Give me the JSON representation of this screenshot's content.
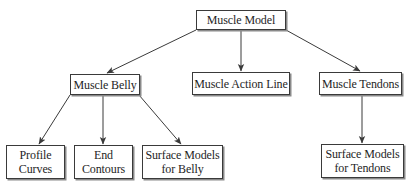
{
  "diagram": {
    "type": "tree",
    "root": {
      "label": "Muscle Model",
      "children": [
        "Muscle Belly",
        "Muscle Action Line",
        "Muscle Tendons"
      ]
    },
    "nodes": {
      "muscle_model": "Muscle Model",
      "muscle_belly": "Muscle Belly",
      "muscle_action_line": "Muscle Action Line",
      "muscle_tendons": "Muscle Tendons",
      "profile_curves": "Profile\nCurves",
      "end_contours": "End\nContours",
      "surface_models_belly": "Surface Models\nfor Belly",
      "surface_models_tendons": "Surface Models\nfor Tendons"
    },
    "edges": [
      {
        "from": "Muscle Model",
        "to": "Muscle Belly"
      },
      {
        "from": "Muscle Model",
        "to": "Muscle Action Line"
      },
      {
        "from": "Muscle Model",
        "to": "Muscle Tendons"
      },
      {
        "from": "Muscle Belly",
        "to": "Profile Curves"
      },
      {
        "from": "Muscle Belly",
        "to": "End Contours"
      },
      {
        "from": "Muscle Belly",
        "to": "Surface Models for Belly"
      },
      {
        "from": "Muscle Tendons",
        "to": "Surface Models for Tendons"
      }
    ],
    "colors": {
      "line": "#3a3a3a",
      "box_border": "#3a3a3a",
      "background": "#ffffff"
    }
  }
}
